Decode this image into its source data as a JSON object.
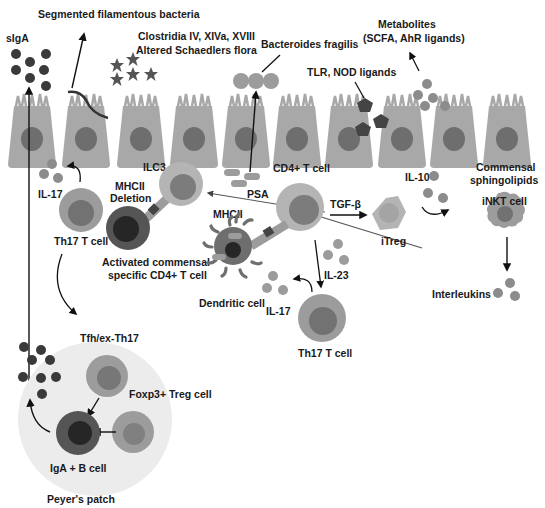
{
  "colors": {
    "background": "#ffffff",
    "epithelium": "#a8a8a8",
    "epithelium_nucleus": "#6e6e6e",
    "dark_particle": "#3a3a3a",
    "mid_particle": "#8c8c8c",
    "light_cell": "#b4b4b4",
    "cell_nucleus": "#7c7c7c",
    "dark_cell": "#555555",
    "dark_nucleus": "#262626",
    "peyers_patch": "#ececec",
    "arrow": "#111111",
    "text": "#1a1a1a"
  },
  "labels": {
    "segmented_bacteria": "Segmented filamentous bacteria",
    "siga": "sIgA",
    "clostridia_1": "Clostridia IV, XIVa, XVIII",
    "clostridia_2": "Altered Schaedlers flora",
    "bacteroides": "Bacteroides fragilis",
    "metabolites_1": "Metabolites",
    "metabolites_2": "(SCFA, AhR ligands)",
    "tlr_nod": "TLR, NOD ligands",
    "il17_left": "IL-17",
    "th17_left": "Th17 T cell",
    "ilc3": "ILC3",
    "mhcii_deletion_1": "MHCII",
    "mhcii_deletion_2": "Deletion",
    "activated_1": "Activated commensal",
    "activated_2": "specific CD4+ T cell",
    "psa": "PSA",
    "cd4": "CD4+ T cell",
    "mhcii": "MHCII",
    "tgfb": "TGF-β",
    "il10": "IL-10",
    "itreg": "iTreg",
    "commensal_1": "Commensal",
    "commensal_2": "sphingolipids",
    "inkt": "iNKT cell",
    "il23": "IL-23",
    "il17_mid": "IL-17",
    "dendritic": "Dendritic cell",
    "th17_mid": "Th17 T cell",
    "interleukins": "Interleukins",
    "tfh": "Tfh/ex-Th17",
    "foxp3": "Foxp3+ Treg cell",
    "iga_b": "IgA + B cell",
    "peyers": "Peyer's patch"
  }
}
